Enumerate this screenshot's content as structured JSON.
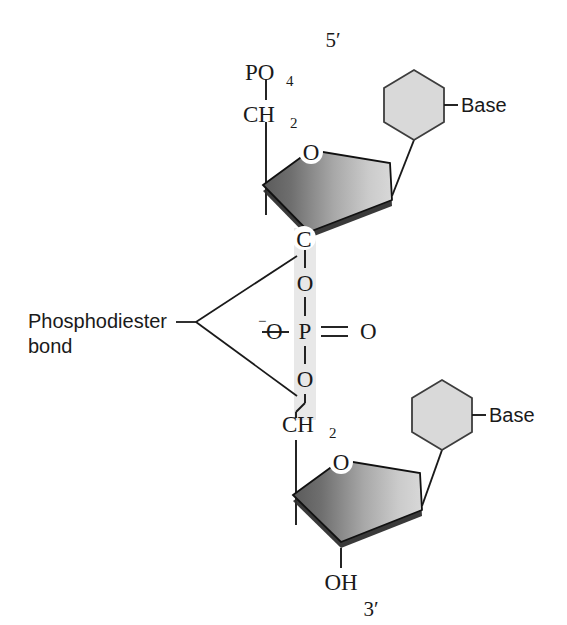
{
  "figure": {
    "background_color": "#ffffff",
    "width": 567,
    "height": 625
  },
  "labels": {
    "five_prime": "5′",
    "three_prime": "3′",
    "phosphate_group": "PO",
    "phosphate_group_sub": "4",
    "methylene_top": "CH",
    "methylene_top_sub": "2",
    "methylene_bottom": "CH",
    "methylene_bottom_sub": "2",
    "ring_oxygen_top": "O",
    "ring_oxygen_bottom": "O",
    "carbon_top": "C",
    "ester_oxygen_upper": "O",
    "ester_oxygen_lower": "O",
    "phosphorus": "P",
    "double_bond_oxygen": "O",
    "anionic_oxygen": "O",
    "anionic_charge": "−",
    "hydroxyl": "OH",
    "base_top": "Base",
    "base_bottom": "Base",
    "callout_line1": "Phosphodiester",
    "callout_line2": "bond"
  },
  "colors": {
    "ink": "#1a1a1a",
    "ring_gradient_dark": "#5f5f5f",
    "ring_gradient_light": "#d2d2d2",
    "ring_edge_shadow": "#2f2f2f",
    "hexagon_fill": "#d9d9d9",
    "hexagon_stroke": "#3d3d3d",
    "highlight_band": "#e8e8e8",
    "background": "#ffffff"
  },
  "structure": {
    "type": "chemical-structure-diagram",
    "description": "Two nucleotides joined by a phosphodiester bond, drawn 5-prime at top and 3-prime at bottom.",
    "nucleotides": [
      {
        "position": "top",
        "end_label": "5′",
        "phosphate": "PO4",
        "linker": "CH2",
        "sugar_ring": "furanose pentagon with ring oxygen O",
        "base": "Base",
        "attached_carbon": "C"
      },
      {
        "position": "bottom",
        "end_label": "3′",
        "linker": "CH2",
        "sugar_ring": "furanose pentagon with ring oxygen O",
        "base": "Base",
        "terminal_group": "OH"
      }
    ],
    "phosphate_center": {
      "atom": "P",
      "substituents": [
        "O (ester, upper)",
        "O (ester, lower)",
        "=O (double bond)",
        "−O (anionic)"
      ]
    },
    "callout": {
      "text": "Phosphodiester bond",
      "points_to": [
        "upper ester oxygen",
        "lower ester oxygen"
      ]
    }
  }
}
